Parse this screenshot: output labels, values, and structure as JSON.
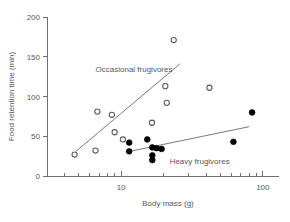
{
  "chart_data": {
    "type": "scatter",
    "title": "",
    "xlabel": "Body mass (g)",
    "ylabel": "Food retention time (min)",
    "xscale": "log",
    "yscale": "linear",
    "xlim": [
      3,
      130
    ],
    "ylim": [
      0,
      200
    ],
    "xticks": [
      10,
      100
    ],
    "xticklabels": [
      "10",
      "100"
    ],
    "yticks": [
      0,
      50,
      100,
      150,
      200
    ],
    "yticklabels": [
      "0",
      "50",
      "100",
      "150",
      "200"
    ],
    "grid": false,
    "legend_position": "inline-annotations",
    "series": [
      {
        "name": "Occasional frugivores",
        "marker": "open-circle",
        "color": "#5d5d5f",
        "points": [
          {
            "x": 4.7,
            "y": 27
          },
          {
            "x": 6.6,
            "y": 32
          },
          {
            "x": 6.8,
            "y": 81
          },
          {
            "x": 8.6,
            "y": 77
          },
          {
            "x": 9.0,
            "y": 55
          },
          {
            "x": 10.3,
            "y": 46
          },
          {
            "x": 16.5,
            "y": 67
          },
          {
            "x": 20.5,
            "y": 113
          },
          {
            "x": 21.0,
            "y": 92
          },
          {
            "x": 23.5,
            "y": 171
          },
          {
            "x": 42.0,
            "y": 111
          }
        ],
        "fit_line": {
          "x1": 4.8,
          "y1": 31,
          "x2": 26.0,
          "y2": 141
        }
      },
      {
        "name": "Heavy frugivores",
        "marker": "filled-circle",
        "color": "#000000",
        "points": [
          {
            "x": 11.4,
            "y": 42
          },
          {
            "x": 11.4,
            "y": 31
          },
          {
            "x": 15.3,
            "y": 46
          },
          {
            "x": 16.6,
            "y": 36
          },
          {
            "x": 16.6,
            "y": 26
          },
          {
            "x": 16.6,
            "y": 20
          },
          {
            "x": 17.8,
            "y": 35
          },
          {
            "x": 19.3,
            "y": 34
          },
          {
            "x": 62.0,
            "y": 43
          },
          {
            "x": 84.0,
            "y": 80
          }
        ],
        "fit_line": {
          "x1": 10.8,
          "y1": 30,
          "x2": 80.0,
          "y2": 62
        }
      }
    ],
    "annotations": [
      {
        "text": "Occasional frugivores",
        "x": 6.6,
        "y": 131
      },
      {
        "text": "Heavy frugivores",
        "x": 22.0,
        "y": 15
      }
    ]
  }
}
